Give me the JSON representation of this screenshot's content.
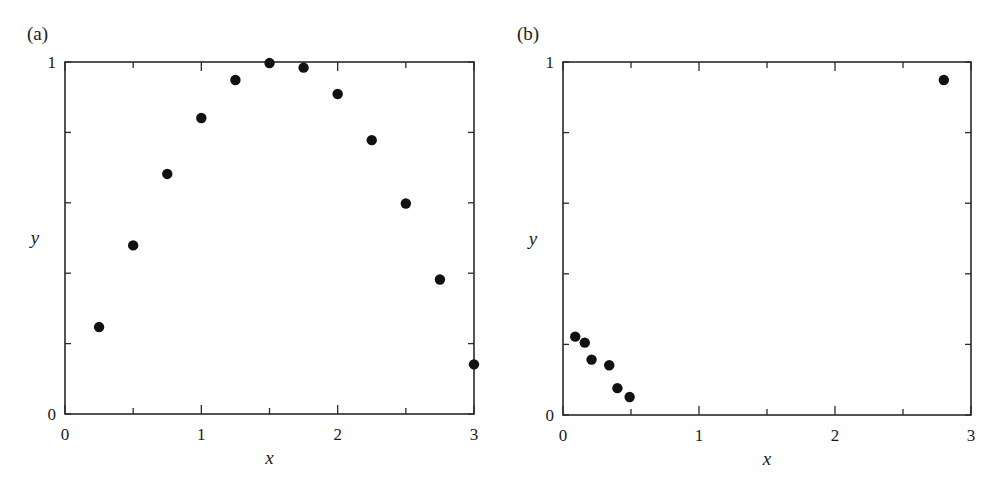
{
  "panels": [
    {
      "label": "(a)"
    },
    {
      "label": "(b)"
    }
  ],
  "chart_data": [
    {
      "type": "scatter",
      "title": "(a)",
      "xlabel": "x",
      "ylabel": "y",
      "xlim": [
        0,
        3
      ],
      "ylim": [
        0,
        1
      ],
      "x_ticks_labeled": [
        0,
        1,
        2,
        3
      ],
      "x_ticks_minor": [
        0.5,
        1.5,
        2.5
      ],
      "y_ticks_labeled": [
        0,
        1
      ],
      "y_ticks_unlabeled": [
        0.2,
        0.4,
        0.6,
        0.8
      ],
      "grid": false,
      "series": [
        {
          "name": "points",
          "x": [
            0.25,
            0.5,
            0.75,
            1.0,
            1.25,
            1.5,
            1.75,
            2.0,
            2.25,
            2.5,
            2.75,
            3.0
          ],
          "y": [
            0.247,
            0.479,
            0.682,
            0.841,
            0.949,
            0.997,
            0.984,
            0.909,
            0.778,
            0.598,
            0.382,
            0.141
          ]
        }
      ]
    },
    {
      "type": "scatter",
      "title": "(b)",
      "xlabel": "x",
      "ylabel": "y",
      "xlim": [
        0,
        3
      ],
      "ylim": [
        0,
        1
      ],
      "x_ticks_labeled": [
        0,
        1,
        2,
        3
      ],
      "x_ticks_minor": [
        0.5,
        1.5,
        2.5
      ],
      "y_ticks_labeled": [
        0,
        1
      ],
      "y_ticks_unlabeled": [
        0.2,
        0.4,
        0.6,
        0.8
      ],
      "grid": false,
      "series": [
        {
          "name": "points",
          "x": [
            0.09,
            0.16,
            0.21,
            0.34,
            0.4,
            0.49,
            2.8
          ],
          "y": [
            0.222,
            0.205,
            0.157,
            0.141,
            0.076,
            0.051,
            0.949
          ]
        }
      ]
    }
  ]
}
